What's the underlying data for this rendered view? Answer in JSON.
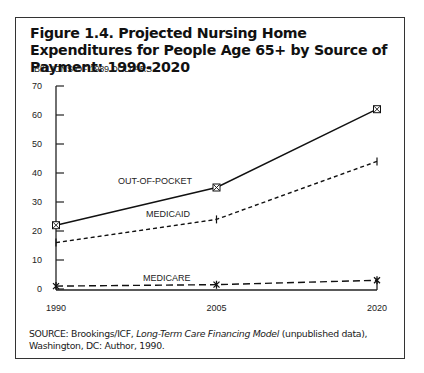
{
  "figure": {
    "title": "Figure 1.4. Projected Nursing Home Expenditures for People Age 65+ by Source of Payment: 1990-2020",
    "source_prefix": "SOURCE: Brookings/ICF, ",
    "source_italic": "Long-Term Care Financing Model",
    "source_suffix": " (unpublished data), Washington, DC: Author, 1990."
  },
  "chart_data": {
    "type": "line",
    "title": "Figure 1.4. Projected Nursing Home Expenditures for People Age 65+ by Source of Payment: 1990-2020",
    "xlabel": "",
    "ylabel": "BILLIONS OF 1989 DOLLARS",
    "x": [
      "1990",
      "2005",
      "2020"
    ],
    "ylim": [
      0,
      70
    ],
    "yticks": [
      0,
      10,
      20,
      30,
      40,
      50,
      60,
      70
    ],
    "grid": false,
    "legend": "inline labels",
    "series": [
      {
        "name": "OUT-OF-POCKET",
        "values": [
          22,
          35,
          62
        ],
        "style": "solid",
        "marker": "boxed-x"
      },
      {
        "name": "MEDICAID",
        "values": [
          16,
          24,
          44
        ],
        "style": "dotted",
        "marker": "tick"
      },
      {
        "name": "MEDICARE",
        "values": [
          1,
          1.5,
          3
        ],
        "style": "dashed",
        "marker": "star"
      }
    ]
  }
}
